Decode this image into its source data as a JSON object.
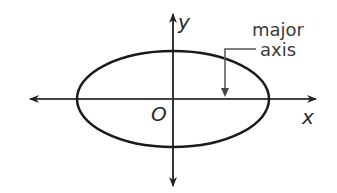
{
  "diagram": {
    "type": "ellipse-on-axes",
    "labels": {
      "y_axis": "y",
      "x_axis": "x",
      "origin": "O",
      "annotation_line1": "major",
      "annotation_line2": "axis"
    },
    "geometry": {
      "center": [
        173,
        99
      ],
      "rx": 96,
      "ry": 48
    },
    "colors": {
      "stroke": "#1a1a1a",
      "axis": "#333333",
      "text": "#2a2a2a"
    }
  }
}
